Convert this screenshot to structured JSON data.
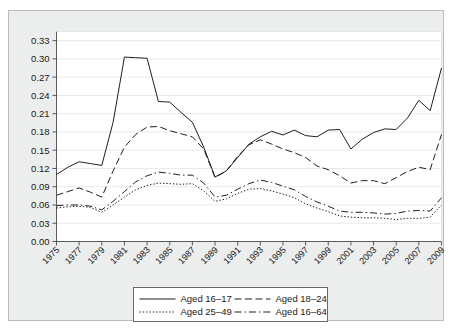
{
  "figure": {
    "background_color": "#eceded",
    "plot_background_color": "#ffffff",
    "line_color": "#1f1f1f",
    "grid_color": "#dfe4e8"
  },
  "chart_data": {
    "type": "line",
    "title": "",
    "subtitle": "",
    "xlabel": "",
    "ylabel": "",
    "xlim": [
      1975,
      2009
    ],
    "ylim": [
      0.0,
      0.345
    ],
    "grid": true,
    "legend_position": "bottom-center",
    "y_ticks": [
      "0.00",
      "0.03",
      "0.06",
      "0.09",
      "0.12",
      "0.15",
      "0.18",
      "0.21",
      "0.24",
      "0.27",
      "0.30",
      "0.33"
    ],
    "y_tick_values": [
      0.0,
      0.03,
      0.06,
      0.09,
      0.12,
      0.15,
      0.18,
      0.21,
      0.24,
      0.27,
      0.3,
      0.33
    ],
    "x_tick_labels": [
      "1975",
      "1977",
      "1979",
      "1981",
      "1983",
      "1985",
      "1987",
      "1989",
      "1991",
      "1993",
      "1995",
      "1997",
      "1999",
      "2001",
      "2003",
      "2005",
      "2007",
      "2009"
    ],
    "x_tick_values": [
      1975,
      1977,
      1979,
      1981,
      1983,
      1985,
      1987,
      1989,
      1991,
      1993,
      1995,
      1997,
      1999,
      2001,
      2003,
      2005,
      2007,
      2009
    ],
    "x": [
      1975,
      1976,
      1977,
      1978,
      1979,
      1980,
      1981,
      1982,
      1983,
      1984,
      1985,
      1986,
      1987,
      1988,
      1989,
      1990,
      1991,
      1992,
      1993,
      1994,
      1995,
      1996,
      1997,
      1998,
      1999,
      2000,
      2001,
      2002,
      2003,
      2004,
      2005,
      2006,
      2007,
      2008,
      2009
    ],
    "series": [
      {
        "name": "Aged 16–17",
        "dash_style": "solid",
        "values": [
          0.11,
          0.122,
          0.131,
          0.128,
          0.125,
          0.196,
          0.303,
          0.302,
          0.301,
          0.23,
          0.229,
          0.212,
          0.196,
          0.155,
          0.106,
          0.116,
          0.138,
          0.16,
          0.172,
          0.181,
          0.175,
          0.183,
          0.174,
          0.172,
          0.183,
          0.184,
          0.152,
          0.168,
          0.179,
          0.185,
          0.184,
          0.203,
          0.232,
          0.215,
          0.285
        ]
      },
      {
        "name": "Aged 18–24",
        "dash_style": "dashed",
        "values": [
          0.076,
          0.082,
          0.088,
          0.081,
          0.073,
          0.116,
          0.155,
          0.176,
          0.188,
          0.189,
          0.182,
          0.177,
          0.172,
          0.152,
          0.105,
          0.116,
          0.14,
          0.159,
          0.167,
          0.16,
          0.152,
          0.146,
          0.138,
          0.124,
          0.118,
          0.108,
          0.096,
          0.1,
          0.1,
          0.095,
          0.105,
          0.115,
          0.122,
          0.118,
          0.176
        ]
      },
      {
        "name": "Aged 25–49",
        "dash_style": "dotted",
        "values": [
          0.055,
          0.057,
          0.058,
          0.056,
          0.048,
          0.06,
          0.073,
          0.085,
          0.092,
          0.096,
          0.095,
          0.094,
          0.095,
          0.083,
          0.066,
          0.07,
          0.079,
          0.086,
          0.087,
          0.083,
          0.078,
          0.072,
          0.062,
          0.055,
          0.049,
          0.042,
          0.04,
          0.039,
          0.039,
          0.038,
          0.036,
          0.038,
          0.038,
          0.04,
          0.06
        ]
      },
      {
        "name": "Aged 16–64",
        "dash_style": "dashdot",
        "values": [
          0.059,
          0.06,
          0.06,
          0.058,
          0.052,
          0.066,
          0.082,
          0.098,
          0.108,
          0.114,
          0.112,
          0.109,
          0.109,
          0.096,
          0.073,
          0.076,
          0.086,
          0.095,
          0.101,
          0.097,
          0.091,
          0.085,
          0.074,
          0.065,
          0.058,
          0.05,
          0.048,
          0.048,
          0.047,
          0.045,
          0.046,
          0.05,
          0.051,
          0.05,
          0.072
        ]
      }
    ]
  },
  "legend": {
    "items": [
      {
        "label": "Aged 16–17",
        "style": "solid"
      },
      {
        "label": "Aged 18–24",
        "style": "dashed"
      },
      {
        "label": "Aged 25–49",
        "style": "dotted"
      },
      {
        "label": "Aged 16–64",
        "style": "dashdot"
      }
    ]
  }
}
